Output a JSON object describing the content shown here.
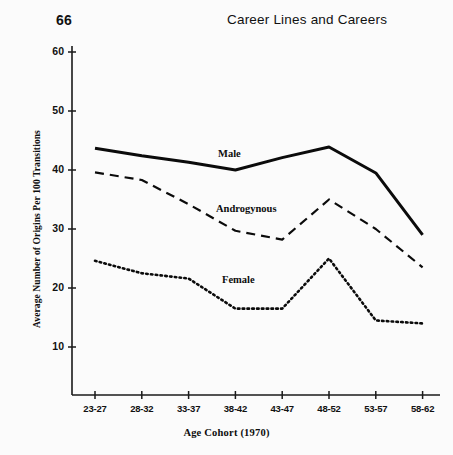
{
  "page": {
    "number": "66",
    "running_head": "Career Lines and Careers"
  },
  "chart_data": {
    "type": "line",
    "title": "",
    "xlabel": "Age Cohort (1970)",
    "ylabel": "Average Number of Origins Per 100 Transitions",
    "categories": [
      "23-27",
      "28-32",
      "33-37",
      "38-42",
      "43-47",
      "48-52",
      "53-57",
      "58-62"
    ],
    "ylim": [
      0,
      60
    ],
    "yticks": [
      10,
      20,
      30,
      40,
      50,
      60
    ],
    "grid": false,
    "legend": "inline-labels",
    "series": [
      {
        "name": "Male",
        "style": "solid",
        "values": [
          43.7,
          42.4,
          41.3,
          40.0,
          42.1,
          43.9,
          39.5,
          29.0
        ]
      },
      {
        "name": "Androgynous",
        "style": "dashed",
        "values": [
          39.6,
          38.3,
          34.2,
          29.7,
          28.2,
          35.0,
          30.0,
          23.5
        ]
      },
      {
        "name": "Female",
        "style": "dotted",
        "values": [
          24.6,
          22.5,
          21.6,
          16.5,
          16.5,
          25.0,
          14.5,
          14.0
        ]
      }
    ],
    "annotations": [
      {
        "text": "Male",
        "x": 218,
        "y": 148
      },
      {
        "text": "Androgynous",
        "x": 216,
        "y": 203
      },
      {
        "text": "Female",
        "x": 222,
        "y": 274
      }
    ]
  }
}
